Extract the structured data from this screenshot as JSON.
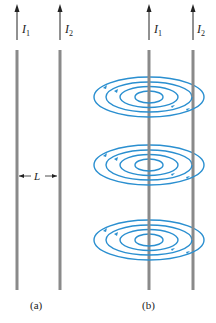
{
  "figure": {
    "panels": [
      {
        "id": "a",
        "caption": "(a)",
        "wires": [
          {
            "label": "I",
            "subscript": "1",
            "x": 17
          },
          {
            "label": "I",
            "subscript": "2",
            "x": 60
          }
        ],
        "dimension": {
          "label": "L",
          "description": "separation between wires"
        }
      },
      {
        "id": "b",
        "caption": "(b)",
        "wires": [
          {
            "label": "I",
            "subscript": "1",
            "x": 149
          },
          {
            "label": "I",
            "subscript": "2",
            "x": 193
          }
        ],
        "field_loops": {
          "groups": 3,
          "rings_per_group": 4,
          "centered_on": "I1",
          "direction": "counterclockwise (viewed from above)"
        }
      }
    ],
    "colors": {
      "wire": "#8a8a8a",
      "arrow": "#222222",
      "field_lines": "#2a8fd0",
      "text": "#222222"
    }
  }
}
